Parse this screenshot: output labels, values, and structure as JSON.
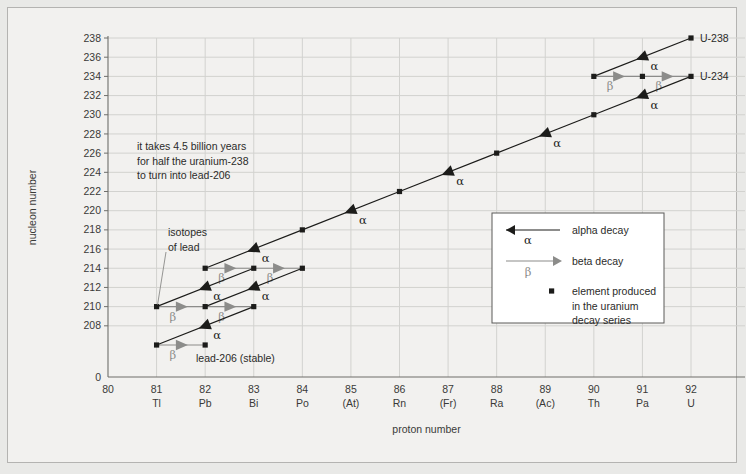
{
  "figure": {
    "background_color": "#e9e9e7",
    "panel_color": "#f2f1ef",
    "border_color": "#b4b3b1"
  },
  "chart_data": {
    "type": "scatter",
    "title": "",
    "xlabel": "proton number",
    "ylabel": "nucleon number",
    "xlim": [
      80,
      92
    ],
    "ylim": [
      206,
      238
    ],
    "grid": true,
    "legend_position": "center-right",
    "x_ticks": [
      80,
      81,
      82,
      83,
      84,
      85,
      86,
      87,
      88,
      89,
      90,
      91,
      92
    ],
    "x_tick_labels": [
      "80",
      "81",
      "82",
      "83",
      "84",
      "85",
      "86",
      "87",
      "88",
      "89",
      "90",
      "91",
      "92"
    ],
    "x_element_symbols": [
      "",
      "Tl",
      "Pb",
      "Bi",
      "Po",
      "(At)",
      "Rn",
      "(Fr)",
      "Ra",
      "(Ac)",
      "Th",
      "Pa",
      "U"
    ],
    "y_ticks": [
      238,
      236,
      234,
      232,
      230,
      228,
      226,
      224,
      222,
      220,
      218,
      216,
      214,
      212,
      210,
      208
    ],
    "y_tick_labels": [
      "238",
      "236",
      "234",
      "232",
      "230",
      "228",
      "226",
      "224",
      "222",
      "220",
      "218",
      "216",
      "214",
      "212",
      "210",
      "208"
    ],
    "y_axis_break_label": "0",
    "nuclides": [
      {
        "z": 92,
        "a": 238,
        "label": "U-238"
      },
      {
        "z": 90,
        "a": 234,
        "label": ""
      },
      {
        "z": 91,
        "a": 234,
        "label": ""
      },
      {
        "z": 92,
        "a": 234,
        "label": "U-234"
      },
      {
        "z": 90,
        "a": 230,
        "label": ""
      },
      {
        "z": 88,
        "a": 226,
        "label": ""
      },
      {
        "z": 86,
        "a": 222,
        "label": ""
      },
      {
        "z": 84,
        "a": 218,
        "label": ""
      },
      {
        "z": 82,
        "a": 214,
        "label": ""
      },
      {
        "z": 83,
        "a": 214,
        "label": ""
      },
      {
        "z": 84,
        "a": 214,
        "label": ""
      },
      {
        "z": 81,
        "a": 210,
        "label": ""
      },
      {
        "z": 82,
        "a": 210,
        "label": ""
      },
      {
        "z": 83,
        "a": 210,
        "label": ""
      },
      {
        "z": 81,
        "a": 206,
        "label": ""
      },
      {
        "z": 82,
        "a": 206,
        "label": ""
      }
    ],
    "alpha_decays": [
      {
        "from_z": 92,
        "from_a": 238,
        "to_z": 90,
        "to_a": 234
      },
      {
        "from_z": 92,
        "from_a": 234,
        "to_z": 90,
        "to_a": 230
      },
      {
        "from_z": 90,
        "from_a": 230,
        "to_z": 88,
        "to_a": 226
      },
      {
        "from_z": 88,
        "from_a": 226,
        "to_z": 86,
        "to_a": 222
      },
      {
        "from_z": 86,
        "from_a": 222,
        "to_z": 84,
        "to_a": 218
      },
      {
        "from_z": 84,
        "from_a": 218,
        "to_z": 82,
        "to_a": 214
      },
      {
        "from_z": 84,
        "from_a": 214,
        "to_z": 82,
        "to_a": 210
      },
      {
        "from_z": 83,
        "from_a": 214,
        "to_z": 81,
        "to_a": 210
      },
      {
        "from_z": 83,
        "from_a": 210,
        "to_z": 81,
        "to_a": 206
      }
    ],
    "beta_decays": [
      {
        "from_z": 90,
        "from_a": 234,
        "to_z": 91,
        "to_a": 234
      },
      {
        "from_z": 91,
        "from_a": 234,
        "to_z": 92,
        "to_a": 234
      },
      {
        "from_z": 82,
        "from_a": 214,
        "to_z": 83,
        "to_a": 214
      },
      {
        "from_z": 83,
        "from_a": 214,
        "to_z": 84,
        "to_a": 214
      },
      {
        "from_z": 81,
        "from_a": 210,
        "to_z": 82,
        "to_a": 210
      },
      {
        "from_z": 82,
        "from_a": 210,
        "to_z": 83,
        "to_a": 210
      },
      {
        "from_z": 81,
        "from_a": 206,
        "to_z": 82,
        "to_a": 206
      }
    ],
    "alpha_symbol": "α",
    "beta_symbol": "β"
  },
  "annotations": {
    "half_life_note": "it takes 4.5 billion years\nfor half the uranium-238\nto turn into lead-206",
    "half_life_lines": [
      "it takes 4.5 billion years",
      "for half the uranium-238",
      "to turn into lead-206"
    ],
    "isotopes_label_lines": [
      "isotopes",
      "of lead"
    ],
    "lead_stable_label": "lead-206 (stable)",
    "u238_label": "U-238",
    "u234_label": "U-234"
  },
  "legend": {
    "alpha_label": "alpha decay",
    "beta_label": "beta decay",
    "marker_lines": [
      "element produced",
      "in the uranium",
      "decay series"
    ],
    "alpha_symbol": "α",
    "beta_symbol": "β"
  },
  "colors": {
    "alpha": "#1c1c1a",
    "beta": "#8c8c8a",
    "marker": "#1c1c1a",
    "grid": "#d2d2cf",
    "axis": "#6e6e6b",
    "text": "#2b2b29"
  }
}
